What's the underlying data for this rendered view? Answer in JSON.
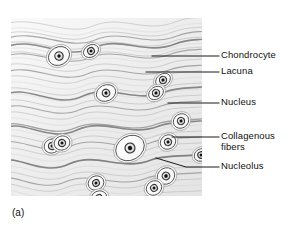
{
  "figure": {
    "caption": "(a)",
    "panel_kind": "light-micrograph-drawing"
  },
  "labels": [
    {
      "id": "chondrocyte",
      "text": "Chondrocyte"
    },
    {
      "id": "lacuna",
      "text": "Lacuna"
    },
    {
      "id": "nucleus",
      "text": "Nucleus"
    },
    {
      "id": "collagenous",
      "text": "Collagenous\nfibers"
    },
    {
      "id": "nucleolus",
      "text": "Nucleolus"
    }
  ],
  "colors": {
    "background": "#ffffff",
    "ink": "#111111",
    "leader_line": "#1a1a1a",
    "matrix_light": "#f4f4f4",
    "matrix_mid": "#c9c9c9",
    "fiber_dark": "#7a7a7a",
    "cell_fill": "#fdfdfd",
    "cell_outline": "#4a4a4a",
    "nucleus_fill": "#e8e8e8",
    "nucleolus_fill": "#151515"
  },
  "leaders": [
    {
      "id": "chondrocyte",
      "points": "152,56 219,56"
    },
    {
      "id": "lacuna",
      "points": "146,72 219,72"
    },
    {
      "id": "nucleus",
      "points": "168,103 219,103"
    },
    {
      "id": "collagenous",
      "points": "172,137 219,137"
    },
    {
      "id": "nucleolus",
      "points": "156,158 186,167 219,167"
    }
  ],
  "cells": [
    {
      "id": "c1",
      "cx": 48,
      "cy": 38,
      "rx": 11,
      "ry": 9,
      "rot": -28,
      "nucleus_r": 4.2,
      "nucleolus_r": 1.7
    },
    {
      "id": "c2",
      "cx": 80,
      "cy": 33,
      "rx": 8,
      "ry": 6,
      "rot": -30,
      "nucleus_r": 3.4,
      "nucleolus_r": 1.5
    },
    {
      "id": "c3",
      "cx": 95,
      "cy": 75,
      "rx": 10,
      "ry": 8,
      "rot": -25,
      "nucleus_r": 3.8,
      "nucleolus_r": 1.6
    },
    {
      "id": "c4",
      "cx": 152,
      "cy": 62,
      "rx": 8,
      "ry": 6,
      "rot": -35,
      "nucleus_r": 3.6,
      "nucleolus_r": 1.6
    },
    {
      "id": "c5",
      "cx": 145,
      "cy": 75,
      "rx": 8,
      "ry": 6,
      "rot": -35,
      "nucleus_r": 3.6,
      "nucleolus_r": 1.6
    },
    {
      "id": "c6",
      "cx": 41,
      "cy": 128,
      "rx": 8,
      "ry": 7,
      "rot": -20,
      "nucleus_r": 3.6,
      "nucleolus_r": 1.5
    },
    {
      "id": "c7",
      "cx": 51,
      "cy": 125,
      "rx": 8,
      "ry": 7,
      "rot": -20,
      "nucleus_r": 3.6,
      "nucleolus_r": 1.5
    },
    {
      "id": "c8",
      "cx": 119,
      "cy": 130,
      "rx": 15,
      "ry": 12,
      "rot": -30,
      "nucleus_r": 5.0,
      "nucleolus_r": 2.2
    },
    {
      "id": "c9",
      "cx": 170,
      "cy": 103,
      "rx": 8,
      "ry": 7,
      "rot": -32,
      "nucleus_r": 3.6,
      "nucleolus_r": 1.6
    },
    {
      "id": "c10",
      "cx": 157,
      "cy": 124,
      "rx": 8,
      "ry": 7,
      "rot": -32,
      "nucleus_r": 3.6,
      "nucleolus_r": 1.6
    },
    {
      "id": "c11",
      "cx": 155,
      "cy": 158,
      "rx": 9,
      "ry": 8,
      "rot": -32,
      "nucleus_r": 3.8,
      "nucleolus_r": 1.8
    },
    {
      "id": "c12",
      "cx": 143,
      "cy": 170,
      "rx": 8,
      "ry": 7,
      "rot": -32,
      "nucleus_r": 3.4,
      "nucleolus_r": 1.5
    },
    {
      "id": "c13",
      "cx": 85,
      "cy": 165,
      "rx": 8,
      "ry": 7,
      "rot": -25,
      "nucleus_r": 3.4,
      "nucleolus_r": 1.5
    },
    {
      "id": "c14",
      "cx": 88,
      "cy": 180,
      "rx": 8,
      "ry": 7,
      "rot": -25,
      "nucleus_r": 3.4,
      "nucleolus_r": 1.5
    },
    {
      "id": "c15",
      "cx": 190,
      "cy": 137,
      "rx": 7,
      "ry": 6,
      "rot": -30,
      "nucleus_r": 3.2,
      "nucleolus_r": 1.4
    },
    {
      "id": "c16",
      "cx": 128,
      "cy": 192,
      "rx": 7,
      "ry": 5,
      "rot": -25,
      "nucleus_r": 3.0,
      "nucleolus_r": 1.3
    },
    {
      "id": "c17",
      "cx": 187,
      "cy": 190,
      "rx": 5,
      "ry": 4,
      "rot": -25,
      "nucleus_r": 2.4,
      "nucleolus_r": 1.2
    }
  ]
}
